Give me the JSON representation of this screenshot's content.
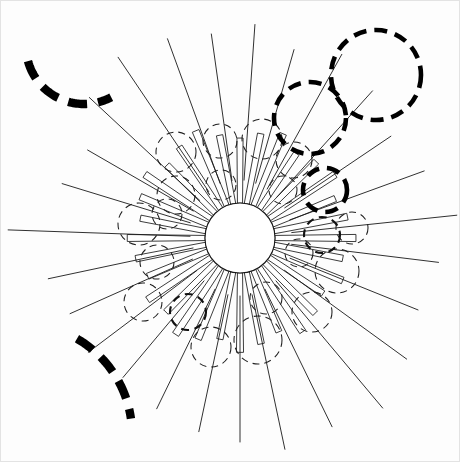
{
  "figure": {
    "canvas": {
      "width": 460,
      "height": 462,
      "background": "#ffffff"
    },
    "palette": {
      "ink": "#1a1a1a",
      "bold_ink": "#000000",
      "thin_ink": "#1f1f1f",
      "paper": "#ffffff",
      "frame": "#e3e3e3"
    },
    "hub": {
      "label": "central-disc",
      "cx": 240,
      "cy": 238,
      "r": 35,
      "fill": "#ffffff",
      "stroke": "#1a1a1a",
      "stroke_width": 1.1
    },
    "petals": {
      "label": "radial-petal-strips",
      "count": 32,
      "inner_radius": 35,
      "outer_radius": 108,
      "half_width_deg": 4.2,
      "taper": 0.42,
      "stroke_width": 0.85
    },
    "rays": {
      "label": "long-radial-lines",
      "stroke_width": 0.9,
      "items": [
        {
          "angle_deg": 258,
          "r0": 48,
          "r1": 196
        },
        {
          "angle_deg": 272,
          "r0": 50,
          "r1": 232
        },
        {
          "angle_deg": 287,
          "r0": 52,
          "r1": 186
        },
        {
          "angle_deg": 300,
          "r0": 54,
          "r1": 176
        },
        {
          "angle_deg": 313,
          "r0": 55,
          "r1": 206
        },
        {
          "angle_deg": 326,
          "r0": 56,
          "r1": 218
        },
        {
          "angle_deg": 340,
          "r0": 58,
          "r1": 212
        },
        {
          "angle_deg": 352,
          "r0": 58,
          "r1": 206
        },
        {
          "angle_deg": 4,
          "r0": 58,
          "r1": 214
        },
        {
          "angle_deg": 16,
          "r0": 57,
          "r1": 196
        },
        {
          "angle_deg": 29,
          "r0": 56,
          "r1": 210
        },
        {
          "angle_deg": 42,
          "r0": 55,
          "r1": 198
        },
        {
          "angle_deg": 56,
          "r0": 54,
          "r1": 182
        },
        {
          "angle_deg": 70,
          "r0": 53,
          "r1": 196
        },
        {
          "angle_deg": 84,
          "r0": 52,
          "r1": 218
        },
        {
          "angle_deg": 97,
          "r0": 52,
          "r1": 200
        },
        {
          "angle_deg": 112,
          "r0": 54,
          "r1": 192
        },
        {
          "angle_deg": 126,
          "r0": 55,
          "r1": 206
        },
        {
          "angle_deg": 140,
          "r0": 56,
          "r1": 222
        },
        {
          "angle_deg": 154,
          "r0": 57,
          "r1": 210
        },
        {
          "angle_deg": 168,
          "r0": 58,
          "r1": 216
        },
        {
          "angle_deg": 180,
          "r0": 58,
          "r1": 204
        },
        {
          "angle_deg": 192,
          "r0": 58,
          "r1": 198
        },
        {
          "angle_deg": 206,
          "r0": 57,
          "r1": 190
        },
        {
          "angle_deg": 220,
          "r0": 56,
          "r1": 182
        },
        {
          "angle_deg": 233,
          "r0": 54,
          "r1": 190
        },
        {
          "angle_deg": 246,
          "r0": 52,
          "r1": 186
        }
      ]
    },
    "circles": {
      "label": "dashed-circle-cluster",
      "thin": [
        {
          "cx": 176,
          "cy": 152,
          "r": 20
        },
        {
          "cx": 220,
          "cy": 141,
          "r": 17
        },
        {
          "cx": 262,
          "cy": 139,
          "r": 20
        },
        {
          "cx": 294,
          "cy": 160,
          "r": 18
        },
        {
          "cx": 176,
          "cy": 195,
          "r": 19
        },
        {
          "cx": 221,
          "cy": 185,
          "r": 15
        },
        {
          "cx": 283,
          "cy": 190,
          "r": 14
        },
        {
          "cx": 139,
          "cy": 224,
          "r": 21
        },
        {
          "cx": 167,
          "cy": 214,
          "r": 15
        },
        {
          "cx": 157,
          "cy": 262,
          "r": 17
        },
        {
          "cx": 143,
          "cy": 302,
          "r": 19
        },
        {
          "cx": 337,
          "cy": 271,
          "r": 22
        },
        {
          "cx": 352,
          "cy": 228,
          "r": 16
        },
        {
          "cx": 312,
          "cy": 312,
          "r": 20
        },
        {
          "cx": 258,
          "cy": 340,
          "r": 24
        },
        {
          "cx": 211,
          "cy": 347,
          "r": 20
        },
        {
          "cx": 266,
          "cy": 298,
          "r": 16
        },
        {
          "cx": 299,
          "cy": 253,
          "r": 14
        }
      ],
      "medium": [
        {
          "cx": 322,
          "cy": 235,
          "r": 18
        },
        {
          "cx": 188,
          "cy": 312,
          "r": 18
        }
      ],
      "bold": [
        {
          "cx": 376,
          "cy": 75,
          "r": 45
        },
        {
          "cx": 310,
          "cy": 118,
          "r": 36
        },
        {
          "cx": 325,
          "cy": 190,
          "r": 22
        }
      ]
    },
    "arcs": {
      "label": "heavy-dashed-arcs",
      "items": [
        {
          "name": "top-left-arc",
          "cx": 84,
          "cy": 46,
          "r": 58,
          "start_deg": 165,
          "end_deg": 62,
          "sweep": "counter"
        },
        {
          "name": "bottom-left-arc",
          "cx": 22,
          "cy": 434,
          "r": 110,
          "start_deg": 300,
          "end_deg": 352,
          "sweep": "clockwise"
        }
      ]
    }
  }
}
